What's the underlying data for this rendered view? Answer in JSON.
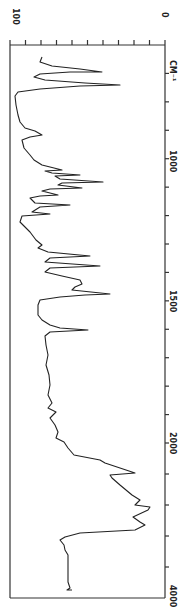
{
  "chart_data": {
    "type": "line",
    "title": "",
    "orientation": "rotated 90deg (wavenumber runs top-to-bottom, transmittance runs right-to-left)",
    "xlabel": "CM⁻¹",
    "ylabel": "Transmittance (%)",
    "x_axis": {
      "label": "CM⁻¹",
      "tick_labels": [
        "1000",
        "1500",
        "2000",
        "4000"
      ],
      "range": [
        600,
        4000
      ],
      "scale": "piecewise: 600–2000 expanded, 2000–4000 compressed (2×)"
    },
    "y_axis": {
      "tick_labels": [
        "100",
        "0"
      ],
      "range": [
        0,
        100
      ],
      "minor_ticks_every": 10
    },
    "grid": false,
    "legend": null,
    "series": [
      {
        "name": "IR spectrum",
        "x": [
          640,
          700,
          760,
          800,
          850,
          900,
          950,
          1000,
          1030,
          1050,
          1070,
          1090,
          1110,
          1130,
          1150,
          1170,
          1200,
          1230,
          1260,
          1300,
          1330,
          1360,
          1390,
          1420,
          1450,
          1470,
          1490,
          1510,
          1560,
          1600,
          1620,
          1650,
          1700,
          1800,
          1900,
          1950,
          2000,
          2050,
          2100,
          2120,
          2150,
          2180,
          2250,
          2300,
          2400,
          2500,
          3000,
          3500,
          3900
        ],
        "y": [
          78,
          40,
          23,
          85,
          78,
          70,
          76,
          72,
          55,
          42,
          30,
          55,
          35,
          60,
          50,
          73,
          45,
          70,
          60,
          74,
          42,
          55,
          35,
          60,
          40,
          30,
          25,
          80,
          80,
          38,
          80,
          80,
          78,
          79,
          78,
          76,
          74,
          70,
          68,
          18,
          45,
          42,
          12,
          15,
          78,
          74,
          70,
          68,
          66
        ]
      }
    ]
  },
  "plot": {
    "box": {
      "left": 10,
      "top": 45,
      "right": 165,
      "bottom": 598
    },
    "line_color": "#222222",
    "axis_color": "#333333",
    "trace_points": [
      [
        42,
        57
      ],
      [
        40,
        62
      ],
      [
        52,
        66
      ],
      [
        80,
        69
      ],
      [
        102,
        72
      ],
      [
        70,
        72
      ],
      [
        40,
        74
      ],
      [
        34,
        77
      ],
      [
        45,
        80
      ],
      [
        85,
        83
      ],
      [
        120,
        85
      ],
      [
        80,
        86
      ],
      [
        40,
        89
      ],
      [
        18,
        92
      ],
      [
        15,
        96
      ],
      [
        16,
        105
      ],
      [
        18,
        115
      ],
      [
        20,
        122
      ],
      [
        25,
        128
      ],
      [
        35,
        131
      ],
      [
        42,
        135
      ],
      [
        30,
        137
      ],
      [
        22,
        140
      ],
      [
        24,
        148
      ],
      [
        30,
        155
      ],
      [
        34,
        160
      ],
      [
        42,
        165
      ],
      [
        50,
        167
      ],
      [
        62,
        170
      ],
      [
        45,
        171
      ],
      [
        52,
        173
      ],
      [
        80,
        175
      ],
      [
        55,
        176
      ],
      [
        60,
        179
      ],
      [
        103,
        182
      ],
      [
        62,
        183
      ],
      [
        58,
        185
      ],
      [
        82,
        188
      ],
      [
        50,
        189
      ],
      [
        42,
        191
      ],
      [
        58,
        195
      ],
      [
        40,
        196
      ],
      [
        30,
        198
      ],
      [
        35,
        203
      ],
      [
        70,
        205
      ],
      [
        40,
        207
      ],
      [
        32,
        212
      ],
      [
        50,
        214
      ],
      [
        22,
        216
      ],
      [
        20,
        222
      ],
      [
        24,
        226
      ],
      [
        30,
        232
      ],
      [
        36,
        240
      ],
      [
        42,
        245
      ],
      [
        38,
        248
      ],
      [
        48,
        252
      ],
      [
        90,
        256
      ],
      [
        50,
        258
      ],
      [
        45,
        262
      ],
      [
        100,
        266
      ],
      [
        50,
        268
      ],
      [
        45,
        272
      ],
      [
        62,
        276
      ],
      [
        80,
        280
      ],
      [
        82,
        284
      ],
      [
        75,
        287
      ],
      [
        72,
        290
      ],
      [
        110,
        294
      ],
      [
        85,
        295
      ],
      [
        60,
        297
      ],
      [
        40,
        300
      ],
      [
        38,
        305
      ],
      [
        38,
        315
      ],
      [
        42,
        320
      ],
      [
        50,
        325
      ],
      [
        60,
        328
      ],
      [
        88,
        330
      ],
      [
        50,
        332
      ],
      [
        45,
        336
      ],
      [
        46,
        345
      ],
      [
        48,
        355
      ],
      [
        46,
        365
      ],
      [
        49,
        375
      ],
      [
        50,
        385
      ],
      [
        48,
        395
      ],
      [
        52,
        403
      ],
      [
        48,
        408
      ],
      [
        56,
        412
      ],
      [
        50,
        418
      ],
      [
        55,
        425
      ],
      [
        58,
        432
      ],
      [
        56,
        438
      ],
      [
        64,
        442
      ],
      [
        68,
        448
      ],
      [
        74,
        455
      ],
      [
        100,
        460
      ],
      [
        105,
        463
      ],
      [
        135,
        473
      ],
      [
        110,
        475
      ],
      [
        112,
        478
      ],
      [
        120,
        485
      ],
      [
        132,
        495
      ],
      [
        140,
        500
      ],
      [
        135,
        505
      ],
      [
        150,
        507
      ],
      [
        148,
        510
      ],
      [
        133,
        517
      ],
      [
        140,
        522
      ],
      [
        145,
        525
      ],
      [
        135,
        530
      ],
      [
        80,
        533
      ],
      [
        65,
        537
      ],
      [
        60,
        540
      ],
      [
        64,
        545
      ],
      [
        65,
        550
      ],
      [
        68,
        555
      ],
      [
        68,
        565
      ],
      [
        68,
        575
      ],
      [
        68,
        582
      ],
      [
        70,
        588
      ],
      [
        67,
        590
      ],
      [
        72,
        590
      ]
    ]
  },
  "labels": {
    "top_left": "100",
    "top_right": "0",
    "unit": "CM⁻¹",
    "tick_1000": "1000",
    "tick_1500": "1500",
    "tick_2000": "2000",
    "tick_4000": "4000"
  }
}
